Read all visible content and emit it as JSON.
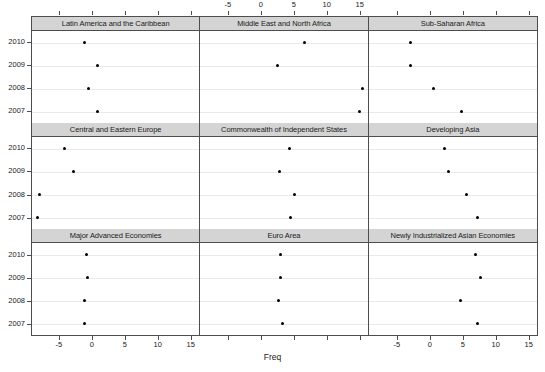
{
  "chart_data": {
    "type": "scatter",
    "title": "",
    "xlabel": "Freq",
    "ylabel": "",
    "xlim": [
      -9.2,
      16.4
    ],
    "ylim_categories": [
      "2010",
      "2009",
      "2008",
      "2007"
    ],
    "xticks": [
      -5,
      0,
      5,
      10,
      15
    ],
    "xtick_labels": [
      "-5",
      "0",
      "5",
      "10",
      "15"
    ],
    "grid": "horizontal",
    "legend": "none",
    "panel_layout": {
      "rows": 3,
      "cols": 3
    },
    "panels": [
      {
        "strip_label": "Latin America and the Caribbean",
        "row": 1,
        "col": 1,
        "points": [
          {
            "year": "2010",
            "freq": -1.1
          },
          {
            "year": "2009",
            "freq": 0.8
          },
          {
            "year": "2008",
            "freq": -0.5
          },
          {
            "year": "2007",
            "freq": 0.8
          }
        ]
      },
      {
        "strip_label": "Middle East and North Africa",
        "row": 1,
        "col": 2,
        "points": [
          {
            "year": "2010",
            "freq": 6.8
          },
          {
            "year": "2009",
            "freq": 2.6
          },
          {
            "year": "2008",
            "freq": 15.6
          },
          {
            "year": "2007",
            "freq": 15.1
          }
        ]
      },
      {
        "strip_label": "Sub-Saharan Africa",
        "row": 1,
        "col": 3,
        "points": [
          {
            "year": "2010",
            "freq": -2.8
          },
          {
            "year": "2009",
            "freq": -2.8
          },
          {
            "year": "2008",
            "freq": 0.7
          },
          {
            "year": "2007",
            "freq": 4.9
          }
        ]
      },
      {
        "strip_label": "Central and Eastern Europe",
        "row": 2,
        "col": 1,
        "points": [
          {
            "year": "2010",
            "freq": -4.3
          },
          {
            "year": "2009",
            "freq": -2.9
          },
          {
            "year": "2008",
            "freq": -8.1
          },
          {
            "year": "2007",
            "freq": -8.4
          }
        ]
      },
      {
        "strip_label": "Commonwealth of Independent States",
        "row": 2,
        "col": 2,
        "points": [
          {
            "year": "2010",
            "freq": 4.4
          },
          {
            "year": "2009",
            "freq": 2.9
          },
          {
            "year": "2008",
            "freq": 5.2
          },
          {
            "year": "2007",
            "freq": 4.6
          }
        ]
      },
      {
        "strip_label": "Developing Asia",
        "row": 2,
        "col": 3,
        "points": [
          {
            "year": "2010",
            "freq": 2.3
          },
          {
            "year": "2009",
            "freq": 2.9
          },
          {
            "year": "2008",
            "freq": 5.7
          },
          {
            "year": "2007",
            "freq": 7.3
          }
        ]
      },
      {
        "strip_label": "Major Advanced Economies",
        "row": 3,
        "col": 1,
        "points": [
          {
            "year": "2010",
            "freq": -0.9
          },
          {
            "year": "2009",
            "freq": -0.7
          },
          {
            "year": "2008",
            "freq": -1.1
          },
          {
            "year": "2007",
            "freq": -1.2
          }
        ]
      },
      {
        "strip_label": "Euro Area",
        "row": 3,
        "col": 2,
        "points": [
          {
            "year": "2010",
            "freq": 3.0
          },
          {
            "year": "2009",
            "freq": 3.0
          },
          {
            "year": "2008",
            "freq": 2.7
          },
          {
            "year": "2007",
            "freq": 3.3
          }
        ]
      },
      {
        "strip_label": "Newly Industrialized Asian Economies",
        "row": 3,
        "col": 3,
        "points": [
          {
            "year": "2010",
            "freq": 7.0
          },
          {
            "year": "2009",
            "freq": 7.8
          },
          {
            "year": "2008",
            "freq": 4.8
          },
          {
            "year": "2007",
            "freq": 7.3
          }
        ]
      }
    ]
  },
  "axes": {
    "x_label": "Freq",
    "x_tick_labels": [
      "-5",
      "0",
      "5",
      "10",
      "15"
    ],
    "y_tick_labels": [
      "2010",
      "2009",
      "2008",
      "2007"
    ]
  }
}
